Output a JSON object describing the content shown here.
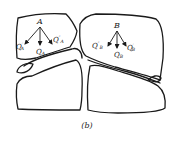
{
  "figure": {
    "caption": "(b)",
    "points": {
      "A": {
        "label": "A",
        "vectors": [
          {
            "name": "Q'A",
            "base": "Q",
            "prime": "′",
            "sub": "A"
          },
          {
            "name": "QA",
            "base": "Q",
            "prime": "",
            "sub": "A"
          },
          {
            "name": "Q''A",
            "base": "Q",
            "prime": "″",
            "sub": "A"
          }
        ]
      },
      "B": {
        "label": "B",
        "vectors": [
          {
            "name": "Q''B",
            "base": "Q",
            "prime": "″",
            "sub": "B"
          },
          {
            "name": "QB",
            "base": "Q",
            "prime": "",
            "sub": "B"
          },
          {
            "name": "Q'B",
            "base": "Q",
            "prime": "′",
            "sub": "B"
          }
        ]
      }
    },
    "colors": {
      "stroke": "#1a1a1a",
      "background": "#ffffff"
    }
  }
}
